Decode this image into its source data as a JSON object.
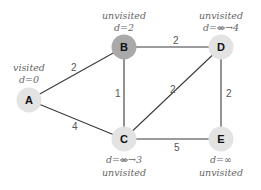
{
  "graph": {
    "title": "Dijkstra's algorithm step",
    "colors": {
      "node_default": "#e3e3e3",
      "node_current": "#a9a9a9",
      "edge": "#3a3a3a",
      "text": "#666666"
    },
    "nodes": [
      {
        "id": "A",
        "label": "A",
        "status": "visited",
        "distance": "d=0",
        "current": false
      },
      {
        "id": "B",
        "label": "B",
        "status": "unvisited",
        "distance": "d=2",
        "current": true
      },
      {
        "id": "C",
        "label": "C",
        "status": "unvisited",
        "distance_prefix": "d=",
        "distance_old": "∞",
        "distance_new": "→3",
        "current": false
      },
      {
        "id": "D",
        "label": "D",
        "status": "unvisited",
        "distance_prefix": "d=",
        "distance_old": "∞",
        "distance_new": "→4",
        "current": false
      },
      {
        "id": "E",
        "label": "E",
        "status": "unvisited",
        "distance": "d=∞",
        "current": false
      }
    ],
    "edges": [
      {
        "from": "A",
        "to": "B",
        "weight": "2"
      },
      {
        "from": "A",
        "to": "C",
        "weight": "4"
      },
      {
        "from": "B",
        "to": "C",
        "weight": "1"
      },
      {
        "from": "B",
        "to": "D",
        "weight": "2"
      },
      {
        "from": "C",
        "to": "D",
        "weight": "2"
      },
      {
        "from": "C",
        "to": "E",
        "weight": "5"
      },
      {
        "from": "D",
        "to": "E",
        "weight": "2"
      }
    ]
  }
}
